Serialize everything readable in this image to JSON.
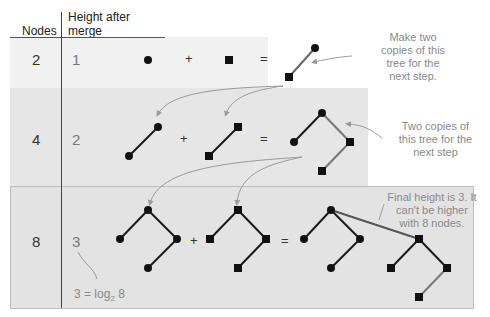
{
  "header": {
    "nodes_label": "Nodes",
    "height_label_line1": "Height after",
    "height_label_line2": "merge"
  },
  "rows": [
    {
      "nodes": "2",
      "height": "1",
      "operator_plus": "+",
      "operator_equals": "="
    },
    {
      "nodes": "4",
      "height": "2",
      "operator_plus": "+",
      "operator_equals": "="
    },
    {
      "nodes": "8",
      "height": "3",
      "operator_plus": "+",
      "operator_equals": "="
    }
  ],
  "annotations": {
    "row1_note": [
      "Make two",
      "copies of this",
      "tree for the",
      "next step."
    ],
    "row2_note": [
      "Two copies of",
      "this tree for the",
      "next step"
    ],
    "row3_note": [
      "Final height is 3. It",
      "can't be higher",
      "with 8 nodes."
    ],
    "log_note_prefix": "3 = log",
    "log_note_sub": "2",
    "log_note_suffix": " 8"
  },
  "legend": {
    "circle_node": "circle-node",
    "square_node": "square-node"
  },
  "colors": {
    "band_gray": "#e3e3e3",
    "band_light": "#efefef",
    "edge_dark": "#1a1a1a",
    "edge_gray": "#777777",
    "arrow_gray": "#9a9a9a",
    "node": "#111111",
    "note_text": "#8a8a8a"
  }
}
